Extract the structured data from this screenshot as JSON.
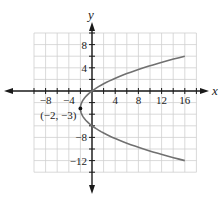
{
  "graph": {
    "x_axis_label": "x",
    "y_axis_label": "y",
    "x_ticks": [
      {
        "value": -8,
        "label": "−8"
      },
      {
        "value": -4,
        "label": "−4"
      },
      {
        "value": 4,
        "label": "4"
      },
      {
        "value": 8,
        "label": "8"
      },
      {
        "value": 12,
        "label": "12"
      },
      {
        "value": 16,
        "label": "16"
      }
    ],
    "y_ticks": [
      {
        "value": 8,
        "label": "8"
      },
      {
        "value": 4,
        "label": "4"
      },
      {
        "value": -8,
        "label": "−8"
      },
      {
        "value": -12,
        "label": "−12"
      }
    ],
    "vertex_label": "(−2, −3)",
    "curve_color": "#707070",
    "grid_color": "#cfcfcf",
    "axis_color": "#1a1a1a"
  },
  "chart_data": {
    "type": "line",
    "title": "",
    "xlabel": "x",
    "ylabel": "y",
    "xlim": [
      -10,
      18
    ],
    "ylim": [
      -14,
      10
    ],
    "grid": true,
    "grid_step": 2,
    "series": [
      {
        "name": "parabola x = (2/9)(y+3)^2 - 2",
        "points": [
          [
            16,
            6
          ],
          [
            10,
            3.35
          ],
          [
            6,
            3
          ],
          [
            2,
            1.24
          ],
          [
            0,
            0
          ],
          [
            -2,
            -3
          ],
          [
            0,
            -6
          ],
          [
            2,
            -7.24
          ],
          [
            6,
            -9
          ],
          [
            10,
            -10.35
          ],
          [
            16,
            -12
          ]
        ]
      }
    ],
    "annotations": [
      {
        "point": [
          -2,
          -3
        ],
        "label": "(−2, −3)"
      }
    ]
  }
}
